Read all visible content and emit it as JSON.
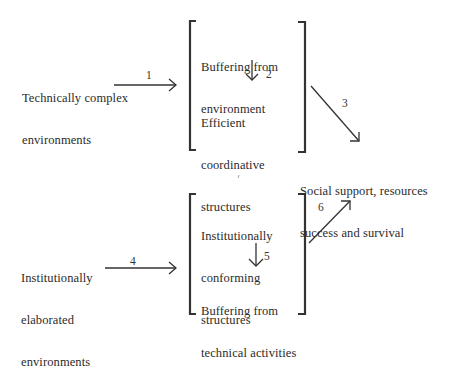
{
  "diagram": {
    "nodes": {
      "technical_env": {
        "line1": "Technically complex",
        "line2": "environments"
      },
      "institutional_env": {
        "line1": "Institutionally",
        "line2": "elaborated",
        "line3": "environments"
      },
      "upper_box": {
        "top": {
          "line1": "Buffering from",
          "line2": "environment"
        },
        "bottom": {
          "line1": "Efficient",
          "line2": "coordinative",
          "line3": "structures"
        }
      },
      "lower_box": {
        "top": {
          "line1": "Institutionally",
          "line2": "conforming",
          "line3": "structures"
        },
        "bottom": {
          "line1": "Buffering from",
          "line2": "technical activities"
        }
      },
      "outcome": {
        "line1": "Social support, resources",
        "line2": "success and survival"
      }
    },
    "edges": [
      {
        "id": "1",
        "label": "1",
        "from": "technical_env",
        "to": "upper_box"
      },
      {
        "id": "2",
        "label": "2",
        "from": "upper_box.top",
        "to": "upper_box.bottom"
      },
      {
        "id": "3",
        "label": "3",
        "from": "upper_box",
        "to": "outcome"
      },
      {
        "id": "4",
        "label": "4",
        "from": "institutional_env",
        "to": "lower_box"
      },
      {
        "id": "5",
        "label": "5",
        "from": "lower_box.top",
        "to": "lower_box.bottom"
      },
      {
        "id": "6",
        "label": "6",
        "from": "lower_box",
        "to": "outcome"
      }
    ],
    "colors": {
      "ink": "#2b2b2b",
      "background": "#ffffff"
    }
  }
}
